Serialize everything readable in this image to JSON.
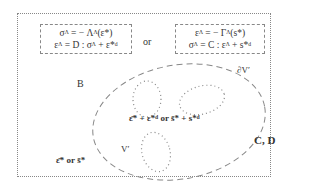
{
  "diagram": {
    "left_box": {
      "line1": "σᴬ = − Λᴬ(ε*)",
      "line2": "εᴬ = D : σᴬ + ε*ᵈ"
    },
    "or_label": "or",
    "right_box": {
      "line1": "εᴬ = − Γᴬ(s*)",
      "line2": "σᴬ = C : εᴬ + s*ᵈ"
    },
    "region_B_label": "B",
    "region_CD_label": "C, D",
    "boundary_label": "∂V′",
    "volume_label": "V′",
    "inner_label": "ε̄* + ε*ᵈ or s̄* + s*ᵈ",
    "far_field_label": "ε̄* or s̄*",
    "colors": {
      "stroke": "#888888",
      "text": "#333333"
    }
  }
}
